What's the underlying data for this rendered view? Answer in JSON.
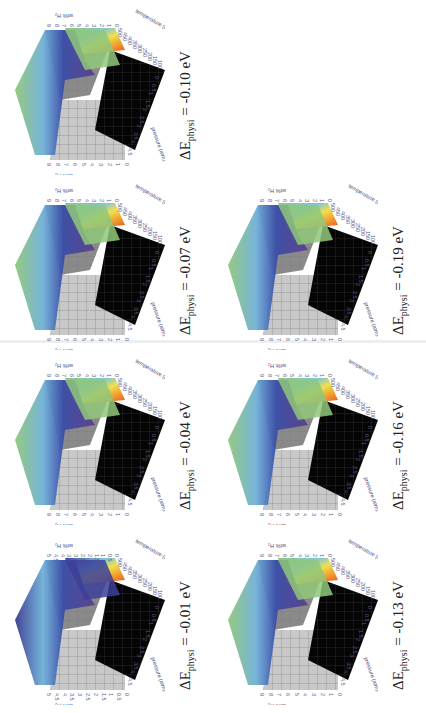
{
  "figure": {
    "orientation": "rotated 90 degrees clockwise",
    "layout": "2 rows x 4 columns (rotated), 7 panels"
  },
  "panels": [
    {
      "id": "a",
      "caption_prefix": "ΔE",
      "caption_sub": "physi",
      "caption_value": " = -0.01 eV",
      "x": 0,
      "y": 530,
      "zmax": 5
    },
    {
      "id": "b",
      "caption_prefix": "ΔE",
      "caption_sub": "physi",
      "caption_value": " = -0.04 eV",
      "x": 0,
      "y": 350,
      "zmax": 9
    },
    {
      "id": "c",
      "caption_prefix": "ΔE",
      "caption_sub": "physi",
      "caption_value": " = -0.07 eV",
      "x": 0,
      "y": 175,
      "zmax": 9
    },
    {
      "id": "d",
      "caption_prefix": "ΔE",
      "caption_sub": "physi",
      "caption_value": " = -0.10 eV",
      "x": 0,
      "y": 0,
      "zmax": 9
    },
    {
      "id": "e",
      "caption_prefix": "ΔE",
      "caption_sub": "physi",
      "caption_value": " = -0.13 eV",
      "x": 213,
      "y": 530,
      "zmax": 9
    },
    {
      "id": "f",
      "caption_prefix": "ΔE",
      "caption_sub": "physi",
      "caption_value": " = -0.16 eV",
      "x": 213,
      "y": 350,
      "zmax": 9
    },
    {
      "id": "g",
      "caption_prefix": "ΔE",
      "caption_sub": "physi",
      "caption_value": " = -0.19 eV",
      "x": 213,
      "y": 175,
      "zmax": 9
    }
  ],
  "chart_data": [
    {
      "type": "surface3d",
      "title": "ΔE_physi = -0.01 eV",
      "xlabel": "pressure (atm)",
      "ylabel": "temperature (K)",
      "zlabel": "wt% H2",
      "x_ticks": [
        "0",
        "0.5",
        "1",
        "1.5",
        "2",
        "2.5",
        "3",
        "3.5",
        "4",
        "4.5"
      ],
      "y_ticks": [
        "100",
        "150",
        "200",
        "250",
        "300",
        "350",
        "400",
        "450",
        "500"
      ],
      "z_ticks": [
        "0",
        "0.5",
        "1",
        "1.5",
        "2",
        "2.5",
        "3",
        "3.5",
        "4",
        "4.5",
        "5"
      ],
      "zlim": [
        0,
        5
      ],
      "colormap": "rainbow (purple low, red high)"
    },
    {
      "type": "surface3d",
      "title": "ΔE_physi = -0.04 eV",
      "xlabel": "pressure (atm)",
      "ylabel": "temperature (K)",
      "zlabel": "wt% H2",
      "x_ticks": [
        "0",
        "0.5",
        "1",
        "1.5",
        "2",
        "2.5",
        "3",
        "3.5",
        "4",
        "4.5"
      ],
      "y_ticks": [
        "100",
        "150",
        "200",
        "250",
        "300",
        "350",
        "400",
        "450",
        "500"
      ],
      "z_ticks": [
        "0",
        "1",
        "2",
        "3",
        "4",
        "5",
        "6",
        "7",
        "8",
        "9"
      ],
      "zlim": [
        0,
        9
      ]
    },
    {
      "type": "surface3d",
      "title": "ΔE_physi = -0.07 eV",
      "xlabel": "pressure (atm)",
      "ylabel": "temperature (K)",
      "zlabel": "wt% H2",
      "x_ticks": [
        "0",
        "0.5",
        "1",
        "1.5",
        "2",
        "2.5",
        "3",
        "3.5",
        "4",
        "4.5"
      ],
      "y_ticks": [
        "100",
        "150",
        "200",
        "250",
        "300",
        "350",
        "400",
        "450",
        "500"
      ],
      "z_ticks": [
        "0",
        "1",
        "2",
        "3",
        "4",
        "5",
        "6",
        "7",
        "8",
        "9"
      ],
      "zlim": [
        0,
        9
      ]
    },
    {
      "type": "surface3d",
      "title": "ΔE_physi = -0.10 eV",
      "xlabel": "pressure (atm)",
      "ylabel": "temperature (K)",
      "zlabel": "wt% H2",
      "x_ticks": [
        "0",
        "0.5",
        "1",
        "1.5",
        "2",
        "2.5",
        "3",
        "3.5",
        "4",
        "4.5"
      ],
      "y_ticks": [
        "100",
        "150",
        "200",
        "250",
        "300",
        "350",
        "400",
        "450",
        "500"
      ],
      "z_ticks": [
        "0",
        "1",
        "2",
        "3",
        "4",
        "5",
        "6",
        "7",
        "8",
        "9"
      ],
      "zlim": [
        0,
        9
      ]
    },
    {
      "type": "surface3d",
      "title": "ΔE_physi = -0.13 eV",
      "xlabel": "pressure (atm)",
      "ylabel": "temperature (K)",
      "zlabel": "wt% H2",
      "x_ticks": [
        "0",
        "0.5",
        "1",
        "1.5",
        "2",
        "2.5",
        "3",
        "3.5",
        "4",
        "4.5"
      ],
      "y_ticks": [
        "100",
        "150",
        "200",
        "250",
        "300",
        "350",
        "400",
        "450",
        "500"
      ],
      "z_ticks": [
        "0",
        "1",
        "2",
        "3",
        "4",
        "5",
        "6",
        "7",
        "8",
        "9"
      ],
      "zlim": [
        0,
        9
      ]
    },
    {
      "type": "surface3d",
      "title": "ΔE_physi = -0.16 eV",
      "xlabel": "pressure (atm)",
      "ylabel": "temperature (K)",
      "zlabel": "wt% H2",
      "x_ticks": [
        "0",
        "0.5",
        "1",
        "1.5",
        "2",
        "2.5",
        "3",
        "3.5",
        "4",
        "4.5"
      ],
      "y_ticks": [
        "100",
        "150",
        "200",
        "250",
        "300",
        "350",
        "400",
        "450",
        "500"
      ],
      "z_ticks": [
        "0",
        "1",
        "2",
        "3",
        "4",
        "5",
        "6",
        "7",
        "8",
        "9"
      ],
      "zlim": [
        0,
        9
      ]
    },
    {
      "type": "surface3d",
      "title": "ΔE_physi = -0.19 eV",
      "xlabel": "pressure (atm)",
      "ylabel": "temperature (K)",
      "zlabel": "wt% H2",
      "x_ticks": [
        "0",
        "0.5",
        "1",
        "1.5",
        "2",
        "2.5",
        "3",
        "3.5",
        "4",
        "4.5"
      ],
      "y_ticks": [
        "100",
        "150",
        "200",
        "250",
        "300",
        "350",
        "400",
        "450",
        "500"
      ],
      "z_ticks": [
        "0",
        "1",
        "2",
        "3",
        "4",
        "5",
        "6",
        "7",
        "8",
        "9"
      ],
      "zlim": [
        0,
        9
      ]
    }
  ],
  "axis_text": {
    "pressure_label": "pressure (atm)",
    "temperature_label": "temperature (K)",
    "wt_label": "wt% H₂"
  },
  "colors": {
    "floor_black": "#050505",
    "wall_grey": "#8a8a8a",
    "wall_light": "#c8c8c8",
    "surface_green": "#8fc77a",
    "surface_purple": "#5b3f8c",
    "surface_blue": "#3a4ea8",
    "surface_red": "#e0452a",
    "surface_yellow": "#f1e04a",
    "tick_text": "#5a5a8a"
  }
}
